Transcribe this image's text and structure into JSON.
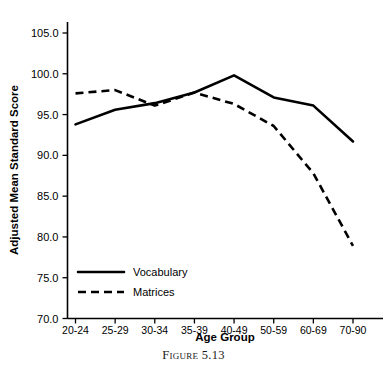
{
  "caption": "Figure 5.13",
  "chart_data": {
    "type": "line",
    "title": "",
    "xlabel": "Age Group",
    "ylabel": "Adjusted Mean Standard Score",
    "categories": [
      "20-24",
      "25-29",
      "30-34",
      "35-39",
      "40-49",
      "50-59",
      "60-69",
      "70-90"
    ],
    "ylim": [
      70.0,
      105.0
    ],
    "yticks": [
      "70.0",
      "75.0",
      "80.0",
      "85.0",
      "90.0",
      "95.0",
      "100.0",
      "105.0"
    ],
    "ytick_values": [
      70.0,
      75.0,
      80.0,
      85.0,
      90.0,
      95.0,
      100.0,
      105.0
    ],
    "grid": false,
    "legend_position": "lower-left-inside",
    "series": [
      {
        "name": "Vocabulary",
        "style": "solid",
        "color": "#000000",
        "values": [
          93.8,
          95.6,
          96.4,
          97.7,
          99.8,
          97.1,
          96.1,
          91.7
        ]
      },
      {
        "name": "Matrices",
        "style": "dashed",
        "color": "#000000",
        "values": [
          97.6,
          98.0,
          96.1,
          97.7,
          96.3,
          93.6,
          87.8,
          78.9
        ]
      }
    ]
  }
}
